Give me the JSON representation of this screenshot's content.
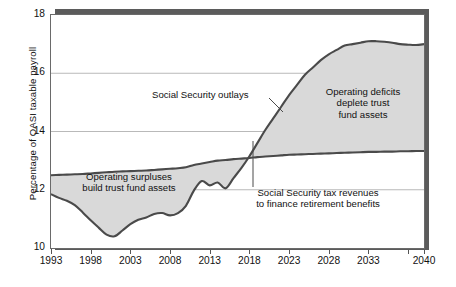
{
  "chart_data": {
    "type": "area",
    "title": "",
    "xlabel": "",
    "ylabel": "Percentage of OASI taxable payroll",
    "xlim": [
      1993,
      2040
    ],
    "ylim": [
      10,
      18
    ],
    "xticks": [
      1993,
      1998,
      2003,
      2008,
      2013,
      2018,
      2023,
      2028,
      2033,
      2040
    ],
    "xtick_labels": [
      "1993",
      "1998",
      "2003",
      "2008",
      "2013",
      "2018",
      "2023",
      "2028",
      "2033",
      "2040"
    ],
    "yticks": [
      10,
      12,
      14,
      16,
      18
    ],
    "ytick_labels": [
      "10",
      "12",
      "14",
      "16",
      "18"
    ],
    "grid": "horizontal",
    "legend_position": "none",
    "fill_color": "#d9d9d9",
    "line_color": "#4a4a4a",
    "x": [
      1993,
      1994,
      1995,
      1996,
      1997,
      1998,
      1999,
      2000,
      2001,
      2002,
      2003,
      2004,
      2005,
      2006,
      2007,
      2008,
      2009,
      2010,
      2011,
      2012,
      2013,
      2014,
      2015,
      2016,
      2017,
      2018,
      2019,
      2020,
      2021,
      2022,
      2023,
      2024,
      2025,
      2026,
      2027,
      2028,
      2029,
      2030,
      2031,
      2032,
      2033,
      2034,
      2035,
      2036,
      2037,
      2038,
      2039,
      2040
    ],
    "series": [
      {
        "name": "Social Security outlays",
        "values": [
          11.85,
          11.72,
          11.62,
          11.47,
          11.22,
          10.95,
          10.7,
          10.46,
          10.4,
          10.6,
          10.82,
          10.97,
          11.05,
          11.17,
          11.2,
          11.12,
          11.2,
          11.45,
          11.97,
          12.3,
          12.15,
          12.25,
          12.05,
          12.4,
          12.75,
          13.15,
          13.6,
          14.05,
          14.45,
          14.85,
          15.25,
          15.6,
          15.95,
          16.2,
          16.45,
          16.65,
          16.8,
          16.95,
          17.0,
          17.05,
          17.1,
          17.1,
          17.08,
          17.05,
          17.0,
          16.98,
          16.97,
          17.0
        ]
      },
      {
        "name": "Social Security tax revenues",
        "values": [
          12.5,
          12.51,
          12.52,
          12.53,
          12.54,
          12.56,
          12.58,
          12.6,
          12.62,
          12.63,
          12.64,
          12.65,
          12.66,
          12.68,
          12.7,
          12.72,
          12.74,
          12.77,
          12.85,
          12.9,
          12.95,
          13.0,
          13.02,
          13.05,
          13.07,
          13.09,
          13.12,
          13.14,
          13.16,
          13.18,
          13.2,
          13.21,
          13.22,
          13.23,
          13.24,
          13.25,
          13.26,
          13.27,
          13.28,
          13.29,
          13.3,
          13.3,
          13.31,
          13.31,
          13.32,
          13.32,
          13.33,
          13.33
        ]
      }
    ],
    "crossover_year": 2016,
    "annotations": [
      {
        "id": "outlays",
        "text": "Social Security outlays"
      },
      {
        "id": "deficits",
        "text": "Operating deficits\ndeplete trust\nfund assets"
      },
      {
        "id": "surpluses",
        "text": "Operating surpluses\nbuild trust fund assets"
      },
      {
        "id": "revenues",
        "text": "Social Security tax revenues\nto finance retirement benefits"
      }
    ]
  }
}
